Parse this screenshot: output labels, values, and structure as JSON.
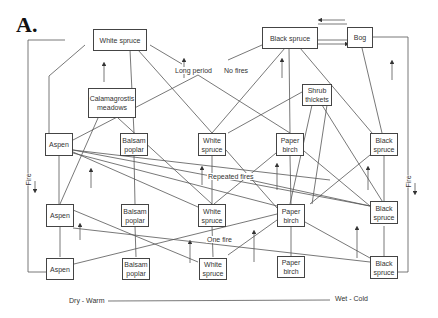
{
  "panel_label": "A.",
  "top": {
    "white_spruce": "White spruce",
    "black_spruce": "Black spruce",
    "bog": "Bog",
    "calamagrostis": "Calamagrostis meadows",
    "shrub_thickets": "Shrub thickets",
    "long_period": "Long period",
    "no_fires": "No fires"
  },
  "rows": [
    {
      "condition": "",
      "boxes": [
        "Aspen",
        "Balsam poplar",
        "White spruce",
        "Paper birch",
        "Black spruce"
      ]
    },
    {
      "condition": "Repeated fires",
      "boxes": [
        "Aspen",
        "Balsam poplar",
        "White spruce",
        "Paper birch",
        "Black spruce"
      ]
    },
    {
      "condition": "One fire",
      "boxes": [
        "Aspen",
        "Balsam poplar",
        "White spruce",
        "Paper birch",
        "Black spruce"
      ]
    }
  ],
  "side_labels": {
    "left": "Fire",
    "right": "Fire"
  },
  "gradient": {
    "left": "Dry - Warm",
    "right": "Wet - Cold"
  }
}
